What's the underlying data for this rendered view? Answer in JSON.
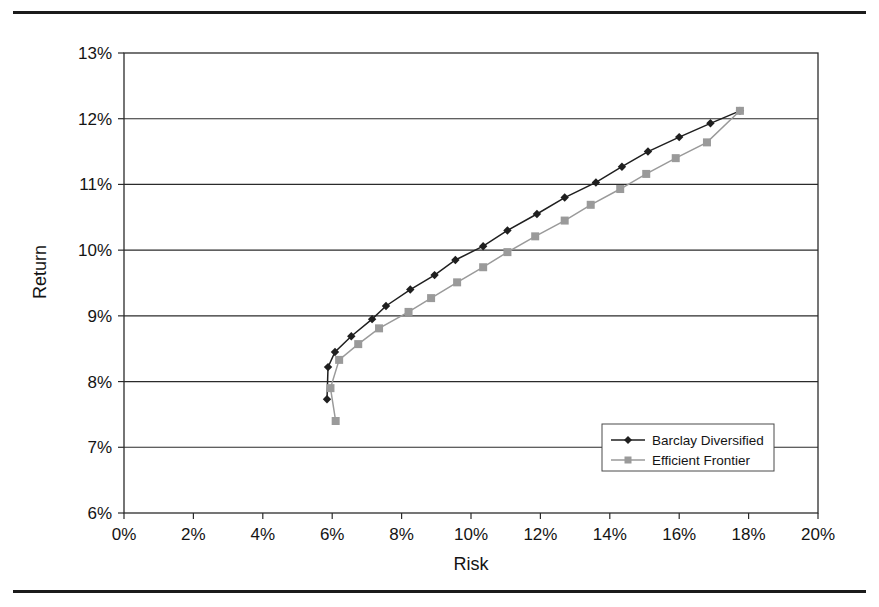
{
  "chart_data": {
    "type": "line",
    "title": "",
    "xlabel": "Risk",
    "ylabel": "Return",
    "xlim": [
      0,
      20
    ],
    "ylim": [
      6,
      13
    ],
    "xticks": [
      "0%",
      "2%",
      "4%",
      "6%",
      "8%",
      "10%",
      "12%",
      "14%",
      "16%",
      "18%",
      "20%"
    ],
    "yticks": [
      "6%",
      "7%",
      "8%",
      "9%",
      "10%",
      "11%",
      "12%",
      "13%"
    ],
    "xtick_values": [
      0,
      2,
      4,
      6,
      8,
      10,
      12,
      14,
      16,
      18,
      20
    ],
    "ytick_values": [
      6,
      7,
      8,
      9,
      10,
      11,
      12,
      13
    ],
    "grid": "horizontal",
    "legend_position": "inside-lower-right",
    "series": [
      {
        "name": "Barclay Diversified",
        "color": "#1f1f1f",
        "marker": "diamond",
        "points": [
          [
            5.85,
            7.73
          ],
          [
            5.88,
            8.22
          ],
          [
            6.08,
            8.45
          ],
          [
            6.55,
            8.69
          ],
          [
            7.15,
            8.95
          ],
          [
            7.55,
            9.15
          ],
          [
            8.25,
            9.4
          ],
          [
            8.95,
            9.62
          ],
          [
            9.55,
            9.85
          ],
          [
            10.35,
            10.06
          ],
          [
            11.05,
            10.3
          ],
          [
            11.9,
            10.55
          ],
          [
            12.7,
            10.8
          ],
          [
            13.6,
            11.03
          ],
          [
            14.35,
            11.27
          ],
          [
            15.1,
            11.5
          ],
          [
            16.0,
            11.72
          ],
          [
            16.9,
            11.93
          ],
          [
            17.75,
            12.12
          ]
        ]
      },
      {
        "name": "Efficient Frontier",
        "color": "#9a9a9a",
        "marker": "square",
        "points": [
          [
            6.1,
            7.4
          ],
          [
            5.95,
            7.9
          ],
          [
            6.2,
            8.33
          ],
          [
            6.75,
            8.57
          ],
          [
            7.35,
            8.81
          ],
          [
            8.2,
            9.06
          ],
          [
            8.85,
            9.27
          ],
          [
            9.6,
            9.51
          ],
          [
            10.35,
            9.74
          ],
          [
            11.05,
            9.97
          ],
          [
            11.85,
            10.21
          ],
          [
            12.7,
            10.45
          ],
          [
            13.45,
            10.69
          ],
          [
            14.3,
            10.93
          ],
          [
            15.05,
            11.16
          ],
          [
            15.9,
            11.4
          ],
          [
            16.8,
            11.64
          ],
          [
            17.75,
            12.12
          ]
        ]
      }
    ]
  },
  "legend": {
    "entries": [
      {
        "label": "Barclay Diversified"
      },
      {
        "label": "Efficient Frontier"
      }
    ]
  },
  "axes": {
    "x_title": "Risk",
    "y_title": "Return"
  }
}
